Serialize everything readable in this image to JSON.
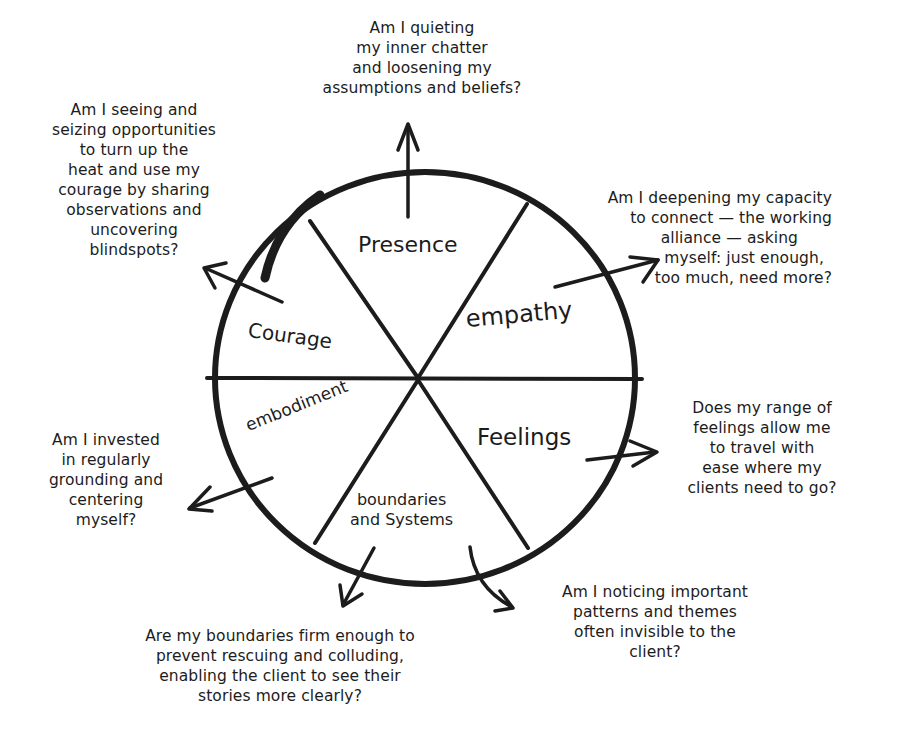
{
  "diagram": {
    "type": "wheel",
    "stroke_color": "#1c1c1c",
    "background": "#ffffff",
    "segments": [
      {
        "id": "presence",
        "label": "Presence"
      },
      {
        "id": "empathy",
        "label": "empathy"
      },
      {
        "id": "feelings",
        "label": "Feelings"
      },
      {
        "id": "boundaries",
        "label_lines": [
          "boundaries",
          "and Systems"
        ]
      },
      {
        "id": "embodiment",
        "label": "embodiment"
      },
      {
        "id": "courage",
        "label": "Courage"
      }
    ],
    "questions": {
      "presence": [
        "Am I quieting",
        "my inner chatter",
        "and loosening my",
        "assumptions and beliefs?"
      ],
      "courage": [
        "Am I seeing and",
        "seizing opportunities",
        "to turn up the",
        "heat and use my",
        "courage by sharing",
        "observations and",
        "uncovering",
        "blindspots?"
      ],
      "empathy": [
        "Am I deepening my capacity",
        "to connect — the working",
        "alliance — asking",
        "myself:  just enough,",
        "too much, need more?"
      ],
      "feelings": [
        "Does my range of",
        "feelings allow me",
        "to travel with",
        "ease where my",
        "clients need to go?"
      ],
      "systems": [
        "Am I noticing important",
        "patterns and themes",
        "often invisible to the",
        "client?"
      ],
      "boundaries": [
        "Are my boundaries firm enough to",
        "prevent rescuing and colluding,",
        "enabling the client to see their",
        "stories more clearly?"
      ],
      "embodiment": [
        "Am I invested",
        "in regularly",
        "grounding and",
        "centering",
        "myself?"
      ]
    }
  }
}
